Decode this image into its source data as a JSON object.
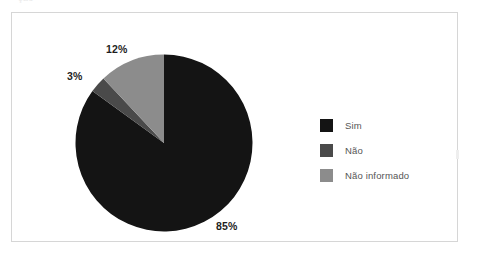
{
  "top_fragment": "ção",
  "chart_data": {
    "type": "pie",
    "title": "",
    "subtitle": "",
    "xlabel": "",
    "ylabel": "",
    "grid": false,
    "legend_position": "right",
    "start_angle_deg": 0,
    "direction": "clockwise",
    "unit": "%",
    "categories": [
      "Sim",
      "Não",
      "Não informado"
    ],
    "values": [
      85,
      3,
      12
    ],
    "data_labels": [
      "85%",
      "3%",
      "12%"
    ],
    "colors": [
      "#141414",
      "#4a4a4a",
      "#8c8c8c"
    ],
    "slices": [
      {
        "label": "Sim",
        "value": 85,
        "data_label": "85%",
        "color": "#141414",
        "angle_deg": 306.0
      },
      {
        "label": "Não",
        "value": 3,
        "data_label": "3%",
        "color": "#4a4a4a",
        "angle_deg": 10.8
      },
      {
        "label": "Não informado",
        "value": 12,
        "data_label": "12%",
        "color": "#8c8c8c",
        "angle_deg": 43.2
      }
    ]
  },
  "legend": {
    "items": [
      {
        "label": "Sim",
        "color": "#141414"
      },
      {
        "label": "Não",
        "color": "#4a4a4a"
      },
      {
        "label": "Não informado",
        "color": "#8c8c8c"
      }
    ]
  },
  "labels": {
    "pct_12": "12%",
    "pct_3": "3%",
    "pct_85": "85%"
  },
  "colors": {
    "frame_border": "#d6d6d6",
    "page_background": "#ffffff",
    "label_text": "#1e1e1e",
    "legend_text": "#555555"
  }
}
